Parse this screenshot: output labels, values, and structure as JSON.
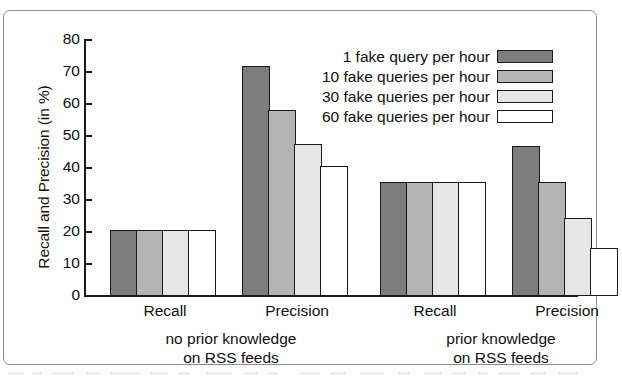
{
  "figure": {
    "frame_color": "#8d8d8d",
    "background": "#ffffff"
  },
  "chart_data": {
    "type": "bar",
    "title": "",
    "xlabel": "",
    "ylabel": "Recall and Precision (in %)",
    "ylim": [
      0,
      80
    ],
    "yticks": [
      0,
      10,
      20,
      30,
      40,
      50,
      60,
      70,
      80
    ],
    "ytick_labels": [
      "0",
      "10",
      "20",
      "30",
      "40",
      "50",
      "60",
      "70",
      "80"
    ],
    "grid": false,
    "legend_position": "top-right",
    "categories": [
      "Recall",
      "Precision",
      "Recall",
      "Precision"
    ],
    "sections": [
      {
        "label_line1": "no prior knowledge",
        "label_line2": "on RSS feeds",
        "groups": [
          0,
          1
        ]
      },
      {
        "label_line1": "prior knowledge",
        "label_line2": "on RSS feeds",
        "groups": [
          2,
          3
        ]
      }
    ],
    "series": [
      {
        "name": "1 fake query per hour",
        "color": "#7d7d7d",
        "values": [
          20.5,
          72.0,
          35.5,
          47.0
        ]
      },
      {
        "name": "10 fake queries per hour",
        "color": "#b4b4b4",
        "values": [
          20.5,
          58.0,
          35.5,
          35.5
        ]
      },
      {
        "name": "30 fake queries per hour",
        "color": "#e6e6e6",
        "values": [
          20.5,
          47.5,
          35.5,
          24.5
        ]
      },
      {
        "name": "60 fake queries per hour",
        "color": "#ffffff",
        "values": [
          20.5,
          40.5,
          35.5,
          15.0
        ]
      }
    ]
  }
}
